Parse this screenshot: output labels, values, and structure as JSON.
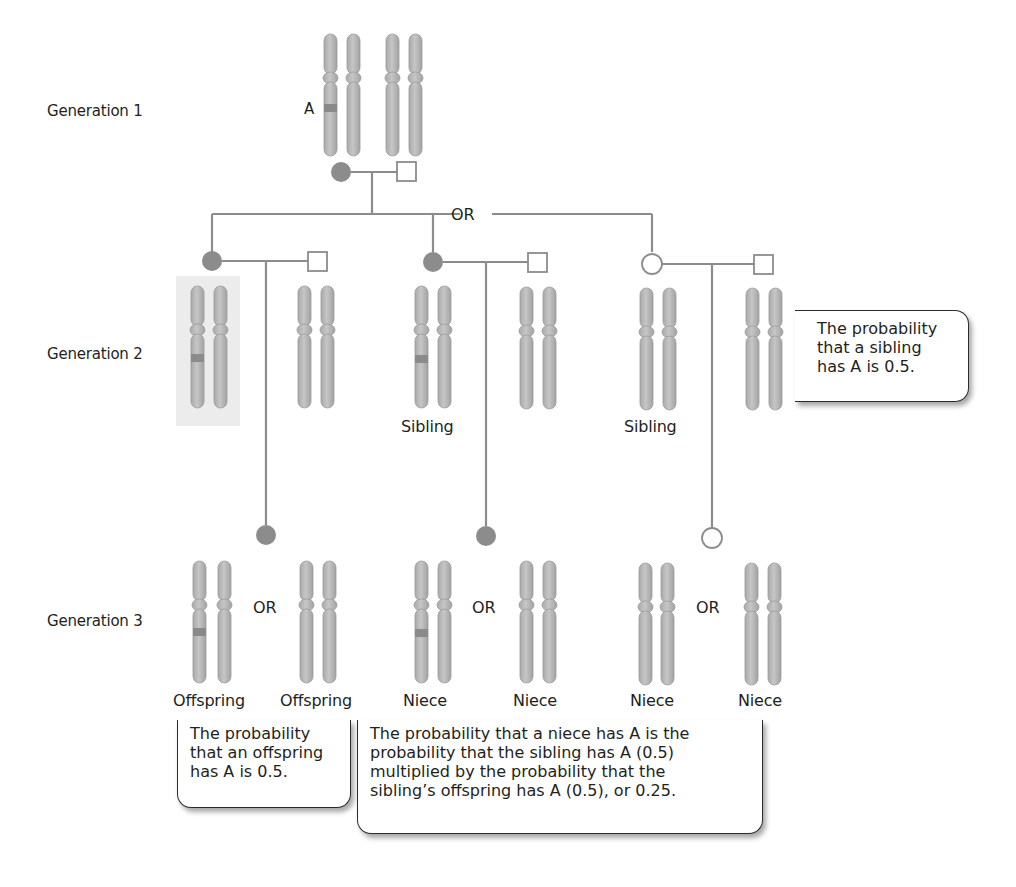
{
  "diagram": {
    "generations": [
      {
        "label": "Generation 1"
      },
      {
        "label": "Generation 2"
      },
      {
        "label": "Generation 3"
      }
    ],
    "gen1": {
      "allele_label": "A",
      "mother": {
        "symbol": "filled-circle",
        "affected": true
      },
      "father": {
        "symbol": "open-square",
        "affected": false
      }
    },
    "or_labels": {
      "gen2_branch": "OR",
      "gen3_offspring": "OR",
      "gen3_niece_affected": "OR",
      "gen3_niece_unaffected": "OR"
    },
    "gen2": {
      "individuals": [
        {
          "role": "proband",
          "label": "",
          "symbol": "filled-circle",
          "carries_A": true,
          "highlighted": true
        },
        {
          "role": "spouse",
          "label": "",
          "symbol": "open-square",
          "carries_A": false
        },
        {
          "role": "sibling",
          "label": "Sibling",
          "symbol": "filled-circle",
          "carries_A": true
        },
        {
          "role": "spouse",
          "label": "",
          "symbol": "open-square",
          "carries_A": false
        },
        {
          "role": "sibling",
          "label": "Sibling",
          "symbol": "open-circle",
          "carries_A": false
        },
        {
          "role": "spouse",
          "label": "",
          "symbol": "open-square",
          "carries_A": false
        }
      ]
    },
    "gen3": {
      "individuals": [
        {
          "label": "Offspring",
          "carries_A": true
        },
        {
          "label": "Offspring",
          "carries_A": false
        },
        {
          "label": "Niece",
          "carries_A": true
        },
        {
          "label": "Niece",
          "carries_A": false
        },
        {
          "label": "Niece",
          "carries_A": false
        },
        {
          "label": "Niece",
          "carries_A": false
        }
      ]
    },
    "callouts": {
      "sibling": {
        "lines": [
          "The probability",
          "that a sibling",
          "has A is 0.5."
        ]
      },
      "offspring": {
        "lines": [
          "The probability",
          "that an offspring",
          "has A is 0.5."
        ]
      },
      "niece": {
        "lines": [
          "The probability that a niece has A is the",
          "probability that the sibling has A (0.5)",
          "multiplied by the probability that the",
          "sibling’s offspring has A (0.5), or 0.25."
        ]
      }
    },
    "colors": {
      "chromosome": "#b3b3b3",
      "chromosome_edge": "#9a9a9a",
      "allele_band": "#8a8a8a",
      "affected_fill": "#8c8c8c",
      "line": "#8c8c8c",
      "highlight_bg": "#ececec"
    }
  }
}
